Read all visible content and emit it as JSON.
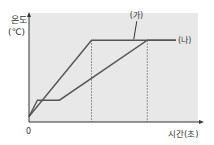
{
  "chart_data": {
    "type": "line",
    "title": "",
    "ylabel_line1": "온도",
    "ylabel_line2": "(℃)",
    "xlabel": "시간(초)",
    "origin_label": "0",
    "xlim": [
      0,
      100
    ],
    "ylim": [
      0,
      100
    ],
    "grid": false,
    "colors": {
      "plot_background": "#e8e8e8",
      "series_line": "#555555",
      "axis": "#333333",
      "dashed": "#777777"
    },
    "series": [
      {
        "name": "(가)",
        "points": [
          [
            0,
            5
          ],
          [
            37,
            75
          ],
          [
            87,
            75
          ]
        ]
      },
      {
        "name": "(나)",
        "points": [
          [
            0,
            5
          ],
          [
            5,
            20
          ],
          [
            18,
            20
          ],
          [
            70,
            75
          ],
          [
            87,
            75
          ]
        ]
      }
    ],
    "dashed_markers_x": [
      37,
      70
    ],
    "annotations": [
      {
        "text": "(가)",
        "series": 0,
        "at_x": 62,
        "at_y": 75
      },
      {
        "text": "(나)",
        "series": 1,
        "at_x": 87,
        "at_y": 75
      }
    ]
  }
}
